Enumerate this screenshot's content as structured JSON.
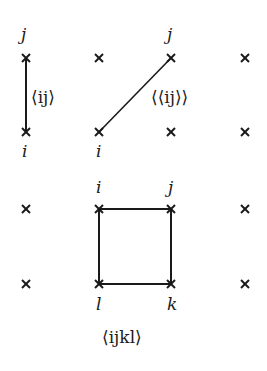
{
  "diagram": {
    "grid": {
      "columns_x": [
        26,
        99,
        171,
        245
      ],
      "rows_y": [
        58,
        132,
        209,
        284
      ]
    },
    "nearest_neighbor": {
      "label": "⟨ij⟩",
      "site_i": "i",
      "site_j": "j"
    },
    "next_nearest_neighbor": {
      "label": "⟨⟨ij⟩⟩",
      "site_i": "i",
      "site_j": "j"
    },
    "plaquette": {
      "label": "⟨ijkl⟩",
      "site_i": "i",
      "site_j": "j",
      "site_k": "k",
      "site_l": "l"
    },
    "colors": {
      "line": "#1a1a1a",
      "background": "#ffffff"
    }
  }
}
